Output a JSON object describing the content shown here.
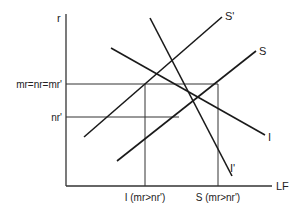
{
  "diagram": {
    "axes": {
      "y_label": "r",
      "x_label": "LF"
    },
    "y_levels": [
      {
        "label": "mr=nr=mr'",
        "y": 84
      },
      {
        "label": "nr'",
        "y": 117
      }
    ],
    "x_levels": [
      {
        "label": "I (mr>nr')",
        "x": 145
      },
      {
        "label": "S (mr>nr')",
        "x": 218
      }
    ],
    "curves": [
      {
        "name": "S'",
        "label": "S'",
        "x1": 84,
        "y1": 137,
        "x2": 222,
        "y2": 17
      },
      {
        "name": "S",
        "label": "S",
        "x1": 117,
        "y1": 161,
        "x2": 256,
        "y2": 51
      },
      {
        "name": "I",
        "label": "I",
        "x1": 111,
        "y1": 48,
        "x2": 265,
        "y2": 135
      },
      {
        "name": "I'",
        "label": "I'",
        "x1": 150,
        "y1": 18,
        "x2": 232,
        "y2": 176
      }
    ],
    "colors": {
      "line": "#1a1a1a",
      "axis": "#333333",
      "text": "#222222",
      "background": "#ffffff"
    }
  }
}
